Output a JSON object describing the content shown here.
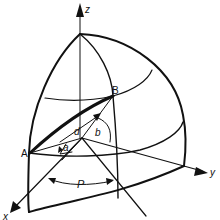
{
  "diagram": {
    "type": "spherical-octant",
    "colors": {
      "stroke": "#111111",
      "background": "#ffffff"
    },
    "axes": {
      "x": {
        "label": "x"
      },
      "y": {
        "label": "y"
      },
      "z": {
        "label": "z"
      }
    },
    "points": {
      "A": {
        "label": "A"
      },
      "B": {
        "label": "B"
      }
    },
    "angles": {
      "a": {
        "label": "a"
      },
      "b": {
        "label": "b"
      },
      "d": {
        "label": "d"
      },
      "P": {
        "label": "P"
      }
    }
  }
}
